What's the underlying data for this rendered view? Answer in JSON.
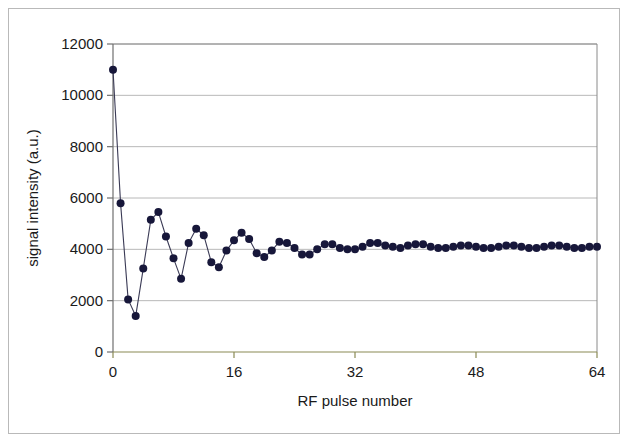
{
  "figure": {
    "background_color": "#ffffff",
    "border_color": "#b9b9b9"
  },
  "chart_data": {
    "type": "line",
    "title": "",
    "subtitle": "",
    "xlabel": "RF pulse number",
    "ylabel": "signal intensity (a.u.)",
    "xlim": [
      0,
      64
    ],
    "ylim": [
      0,
      12000
    ],
    "xticks": [
      0,
      16,
      32,
      48,
      64
    ],
    "xtick_labels": [
      "0",
      "16",
      "32",
      "48",
      "64"
    ],
    "yticks": [
      0,
      2000,
      4000,
      6000,
      8000,
      10000,
      12000
    ],
    "ytick_labels": [
      "0",
      "2000",
      "4000",
      "6000",
      "8000",
      "10000",
      "12000"
    ],
    "grid": {
      "horizontal": true,
      "vertical": false,
      "color": "#b0b0b0"
    },
    "legend": {
      "visible": false,
      "position": "none",
      "entries": []
    },
    "marker": {
      "shape": "circle",
      "color": "#17173a",
      "size": 8
    },
    "line": {
      "color": "#3a3a55",
      "width": 1.1
    },
    "annotations": [],
    "series": [
      {
        "name": "signal intensity",
        "x": [
          0,
          1,
          2,
          3,
          4,
          5,
          6,
          7,
          8,
          9,
          10,
          11,
          12,
          13,
          14,
          15,
          16,
          17,
          18,
          19,
          20,
          21,
          22,
          23,
          24,
          25,
          26,
          27,
          28,
          29,
          30,
          31,
          32,
          33,
          34,
          35,
          36,
          37,
          38,
          39,
          40,
          41,
          42,
          43,
          44,
          45,
          46,
          47,
          48,
          49,
          50,
          51,
          52,
          53,
          54,
          55,
          56,
          57,
          58,
          59,
          60,
          61,
          62,
          63,
          64
        ],
        "values": [
          11000,
          5800,
          2050,
          1400,
          3250,
          5150,
          5450,
          4500,
          3650,
          2850,
          4250,
          4800,
          4550,
          3500,
          3300,
          3950,
          4350,
          4650,
          4400,
          3850,
          3700,
          3950,
          4300,
          4250,
          4050,
          3800,
          3800,
          4000,
          4200,
          4200,
          4050,
          4000,
          4000,
          4100,
          4250,
          4250,
          4150,
          4100,
          4050,
          4150,
          4200,
          4200,
          4100,
          4050,
          4050,
          4100,
          4150,
          4150,
          4100,
          4050,
          4050,
          4100,
          4150,
          4150,
          4100,
          4050,
          4050,
          4100,
          4150,
          4150,
          4100,
          4050,
          4050,
          4100,
          4100
        ]
      }
    ]
  }
}
